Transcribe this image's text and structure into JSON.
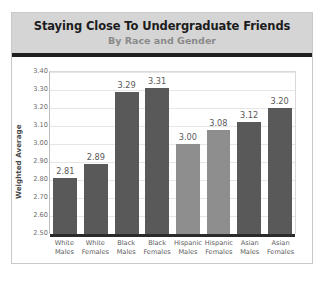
{
  "chart_data": {
    "type": "bar",
    "title": "Staying Close To Undergraduate Friends",
    "subtitle": "By Race and Gender",
    "xlabel": "",
    "ylabel": "Weighted Average",
    "ylim": [
      2.5,
      3.4
    ],
    "ytick_step": 0.1,
    "ytick_labels": [
      "3.40",
      "3.30",
      "3.20",
      "3.10",
      "3.00",
      "2.90",
      "2.80",
      "2.70",
      "2.60",
      "2.50"
    ],
    "grid": true,
    "legend": "none",
    "categories": [
      "White Males",
      "White Females",
      "Black Males",
      "Black Females",
      "Hispanic Males",
      "Hispanic Females",
      "Asian Males",
      "Asian Females"
    ],
    "category_lines": [
      [
        "White",
        "Males"
      ],
      [
        "White",
        "Females"
      ],
      [
        "Black",
        "Males"
      ],
      [
        "Black",
        "Females"
      ],
      [
        "Hispanic",
        "Males"
      ],
      [
        "Hispanic",
        "Females"
      ],
      [
        "Asian",
        "Males"
      ],
      [
        "Asian",
        "Females"
      ]
    ],
    "values": [
      2.81,
      2.89,
      3.29,
      3.31,
      3.0,
      3.08,
      3.12,
      3.2
    ],
    "value_labels": [
      "2.81",
      "2.89",
      "3.29",
      "3.31",
      "3.00",
      "3.08",
      "3.12",
      "3.20"
    ],
    "bar_colors": [
      "#595959",
      "#595959",
      "#595959",
      "#595959",
      "#8e8e8e",
      "#8e8e8e",
      "#595959",
      "#595959"
    ]
  },
  "style": {
    "title_band_color": "#d5d5d5",
    "title_rule_color": "#1f1f1f",
    "card_border_color": "#c9c9c9",
    "gridline_color": "#e6e6e6",
    "baseline_color": "#2b2b2b",
    "bar_dark": "#595959",
    "bar_light": "#8e8e8e",
    "title_text_color": "#1c1c1c",
    "subtitle_text_color": "#8a8a8a",
    "tick_text_color": "#6d6d6d",
    "value_text_color": "#5a5a5a",
    "category_text_color": "#5d5d5d"
  }
}
